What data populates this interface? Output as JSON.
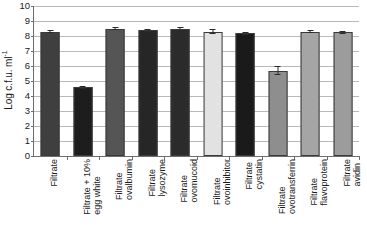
{
  "chart_data": {
    "type": "bar",
    "title": "",
    "xlabel": "",
    "ylabel": "Log c.f.u. ml",
    "ylabel_exponent": "-1",
    "ylim": [
      0,
      10
    ],
    "yticks": [
      0,
      1,
      2,
      3,
      4,
      5,
      6,
      7,
      8,
      9,
      10
    ],
    "grid": true,
    "legend": "none",
    "categories": [
      "Filtrate",
      "Filtrate + 10% egg white",
      "Filtrate ovalbumin",
      "Filtrate lysozyme",
      "Filtrate ovomucoid",
      "Filtrate ovoinhibitor",
      "Filtrate cystatin",
      "Filtrate ovotransferrin",
      "Filtrate flavoprotein",
      "Filtrate avidin"
    ],
    "values": [
      8.3,
      4.6,
      8.5,
      8.4,
      8.45,
      8.3,
      8.2,
      5.7,
      8.3,
      8.25
    ],
    "errors": [
      0.1,
      0.08,
      0.1,
      0.1,
      0.12,
      0.15,
      0.1,
      0.3,
      0.12,
      0.1
    ],
    "bar_fills": [
      "#3f3f3f",
      "#1d1d1d",
      "#555555",
      "#262626",
      "#2b2b2b",
      "#e2e2e2",
      "#1a1a1a",
      "#8e8e8e",
      "#a5a5a5",
      "#9c9c9c"
    ]
  },
  "bars": [
    {
      "label_line1": "Filtrate",
      "label_line2": "",
      "value": 8.3,
      "error": 0.1
    },
    {
      "label_line1": "Filtrate + 10%",
      "label_line2": "egg white",
      "value": 4.6,
      "error": 0.08
    },
    {
      "label_line1": "Filtrate",
      "label_line2": "ovalbumin",
      "value": 8.5,
      "error": 0.1
    },
    {
      "label_line1": "Filtrate",
      "label_line2": "lysozyme",
      "value": 8.4,
      "error": 0.1
    },
    {
      "label_line1": "Filtrate",
      "label_line2": "ovomucoid",
      "value": 8.45,
      "error": 0.12
    },
    {
      "label_line1": "Filtrate",
      "label_line2": "ovoinhibitor",
      "value": 8.3,
      "error": 0.15
    },
    {
      "label_line1": "Filtrate",
      "label_line2": "cystatin",
      "value": 8.2,
      "error": 0.1
    },
    {
      "label_line1": "Filtrate",
      "label_line2": "ovotransferrin",
      "value": 5.7,
      "error": 0.3
    },
    {
      "label_line1": "Filtrate",
      "label_line2": "flavoprotein",
      "value": 8.3,
      "error": 0.12
    },
    {
      "label_line1": "Filtrate",
      "label_line2": "avidin",
      "value": 8.25,
      "error": 0.1
    }
  ]
}
